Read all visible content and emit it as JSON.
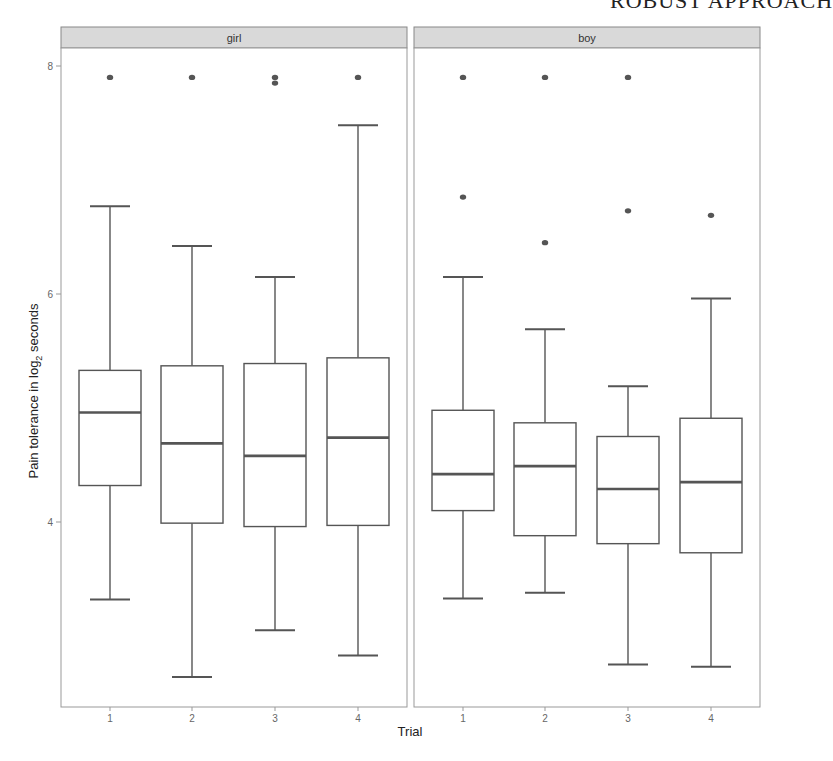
{
  "running_header": "ROBUST APPROACH",
  "chart_data": {
    "type": "boxplot",
    "title": "",
    "xlabel": "Trial",
    "ylabel": "Pain tolerance in log2 seconds",
    "ylabel_parts": {
      "main": "Pain tolerance in log",
      "sub": "2",
      "tail": " seconds"
    },
    "yticks": [
      4,
      6,
      8
    ],
    "ylim": [
      2.25,
      8.25
    ],
    "categories": [
      "1",
      "2",
      "3",
      "4"
    ],
    "facets": [
      {
        "name": "girl",
        "boxes": [
          {
            "trial": "1",
            "lower_whisker": 3.32,
            "q1": 4.32,
            "median": 4.96,
            "q3": 5.33,
            "upper_whisker": 6.77,
            "outliers": [
              7.9
            ]
          },
          {
            "trial": "2",
            "lower_whisker": 2.64,
            "q1": 3.99,
            "median": 4.69,
            "q3": 5.37,
            "upper_whisker": 6.42,
            "outliers": [
              7.9
            ]
          },
          {
            "trial": "3",
            "lower_whisker": 3.05,
            "q1": 3.96,
            "median": 4.58,
            "q3": 5.39,
            "upper_whisker": 6.15,
            "outliers": [
              7.9,
              7.85
            ]
          },
          {
            "trial": "4",
            "lower_whisker": 2.83,
            "q1": 3.97,
            "median": 4.74,
            "q3": 5.44,
            "upper_whisker": 7.48,
            "outliers": [
              7.9
            ]
          }
        ]
      },
      {
        "name": "boy",
        "boxes": [
          {
            "trial": "1",
            "lower_whisker": 3.33,
            "q1": 4.1,
            "median": 4.42,
            "q3": 4.98,
            "upper_whisker": 6.15,
            "outliers": [
              7.9,
              6.85
            ]
          },
          {
            "trial": "2",
            "lower_whisker": 3.38,
            "q1": 3.88,
            "median": 4.49,
            "q3": 4.87,
            "upper_whisker": 5.69,
            "outliers": [
              7.9,
              6.45
            ]
          },
          {
            "trial": "3",
            "lower_whisker": 2.75,
            "q1": 3.81,
            "median": 4.29,
            "q3": 4.75,
            "upper_whisker": 5.19,
            "outliers": [
              7.9,
              6.73
            ]
          },
          {
            "trial": "4",
            "lower_whisker": 2.73,
            "q1": 3.73,
            "median": 4.35,
            "q3": 4.91,
            "upper_whisker": 5.96,
            "outliers": [
              6.69
            ]
          }
        ]
      }
    ],
    "grid": false,
    "legend": "none"
  },
  "colors": {
    "strip_fill": "#d9d9d9",
    "strip_border": "#888888",
    "panel_border": "#999999",
    "box_line": "#555555",
    "outlier": "#555555",
    "tick_text": "#666666"
  }
}
